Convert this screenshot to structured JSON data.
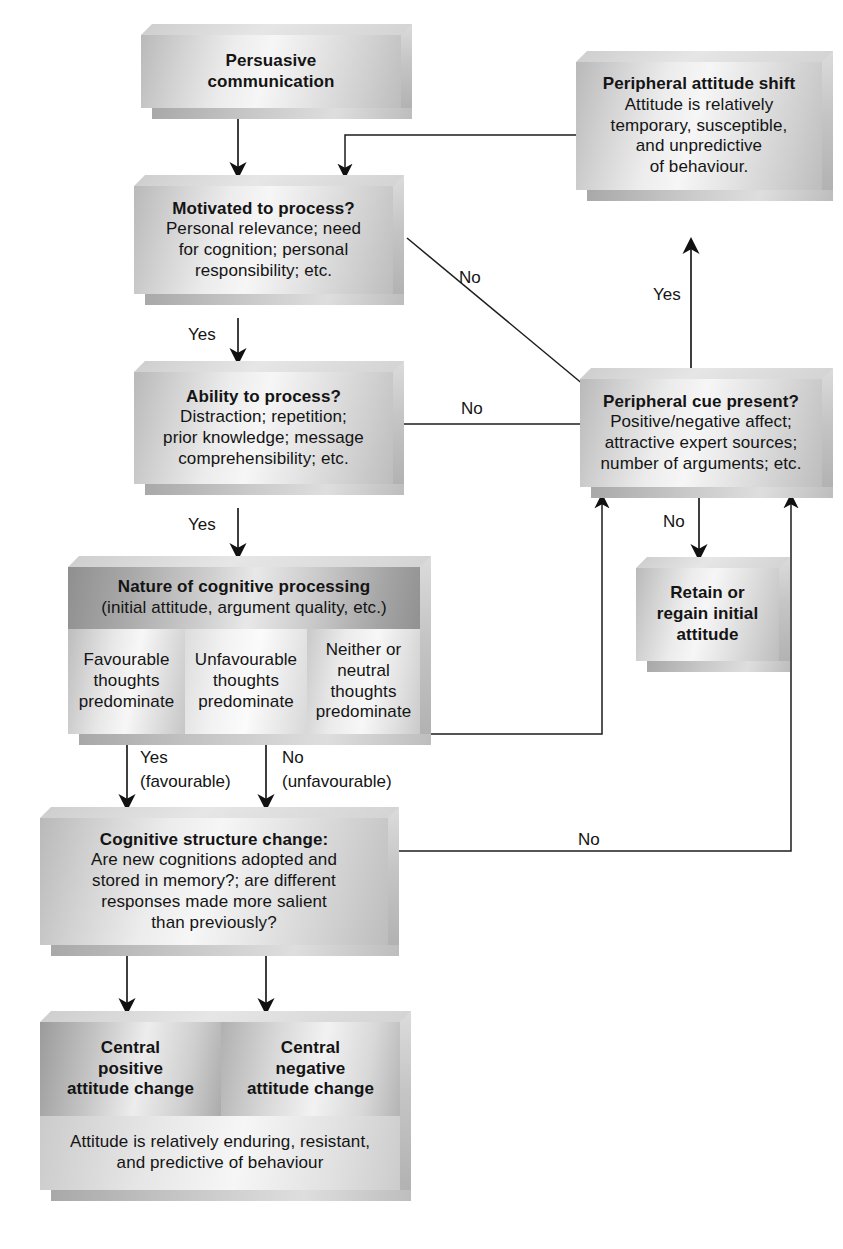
{
  "diagram": {
    "nodes": {
      "persuasive_communication": {
        "title": "Persuasive",
        "title2": "communication"
      },
      "peripheral_attitude_shift": {
        "title": "Peripheral attitude shift",
        "line1": "Attitude is relatively",
        "line2": "temporary, susceptible,",
        "line3": "and unpredictive",
        "line4": "of behaviour."
      },
      "motivated_to_process": {
        "title": "Motivated to process?",
        "line1": "Personal relevance; need",
        "line2": "for cognition; personal",
        "line3": "responsibility; etc."
      },
      "ability_to_process": {
        "title": "Ability to process?",
        "line1": "Distraction; repetition;",
        "line2": "prior knowledge; message",
        "line3": "comprehensibility; etc."
      },
      "peripheral_cue_present": {
        "title": "Peripheral cue present?",
        "line1": "Positive/negative affect;",
        "line2": "attractive expert sources;",
        "line3": "number of arguments; etc."
      },
      "nature_of_cognitive_processing": {
        "title": "Nature of cognitive processing",
        "subtitle": "(initial attitude, argument quality, etc.)",
        "cells": [
          {
            "line1": "Favourable",
            "line2": "thoughts",
            "line3": "predominate"
          },
          {
            "line1": "Unfavourable",
            "line2": "thoughts",
            "line3": "predominate"
          },
          {
            "line1": "Neither or",
            "line2": "neutral thoughts",
            "line3": "predominate"
          }
        ]
      },
      "retain_or_regain": {
        "line1": "Retain or",
        "line2": "regain initial",
        "line3": "attitude"
      },
      "cognitive_structure_change": {
        "title": "Cognitive structure change:",
        "line1": "Are new cognitions adopted and",
        "line2": "stored in memory?; are different",
        "line3": "responses made more salient",
        "line4": "than previously?"
      },
      "central_attitude_change": {
        "left": {
          "line1": "Central",
          "line2": "positive",
          "line3": "attitude change"
        },
        "right": {
          "line1": "Central",
          "line2": "negative",
          "line3": "attitude change"
        },
        "footer_line1": "Attitude is relatively enduring, resistant,",
        "footer_line2": "and predictive of behaviour"
      }
    },
    "edge_labels": {
      "motivated_no": "No",
      "motivated_yes": "Yes",
      "ability_no": "No",
      "ability_yes": "Yes",
      "peripheral_shift_yes": "Yes",
      "peripheral_cue_no": "No",
      "favourable_yes": "Yes",
      "favourable_yes_paren": "(favourable)",
      "unfavourable_no": "No",
      "unfavourable_no_paren": "(unfavourable)",
      "cognitive_structure_no": "No"
    }
  }
}
